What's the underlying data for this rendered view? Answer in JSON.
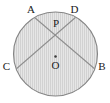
{
  "figure": {
    "kind": "circle-geometry-diagram",
    "canvas": {
      "width": 110,
      "height": 103
    },
    "colors": {
      "fill": "#e2e2e2",
      "hatch": "#cfcfcf",
      "outline": "#7d7d7d",
      "chord": "#8a8a8a",
      "label": "#1a1a1a",
      "background": "#ffffff"
    },
    "circle": {
      "center_x": 55.5,
      "center_y": 54.0,
      "radius": 42.0,
      "filled": true,
      "hatched": true,
      "hatch_orientation": "vertical",
      "hatch_spacing": 2
    },
    "center_marker": {
      "label": "O",
      "dot_x": 55.5,
      "dot_y": 57.0,
      "label_x": 55.5,
      "label_y": 66.0,
      "has_dot": true
    },
    "points": [
      {
        "name": "A",
        "label": "A",
        "x": 34.0,
        "y": 17.0,
        "label_x": 31.0,
        "label_y": 9.0
      },
      {
        "name": "D",
        "label": "D",
        "x": 76.0,
        "y": 17.0,
        "label_x": 74.0,
        "label_y": 9.0
      },
      {
        "name": "C",
        "label": "C",
        "x": 15.0,
        "y": 70.0,
        "label_x": 6.0,
        "label_y": 66.0
      },
      {
        "name": "B",
        "label": "B",
        "x": 96.0,
        "y": 70.0,
        "label_x": 101.0,
        "label_y": 66.0
      },
      {
        "name": "P",
        "label": "P",
        "x": 55.5,
        "y": 31.0,
        "label_x": 56.0,
        "label_y": 23.0
      }
    ],
    "chords": [
      {
        "name": "chord-AB",
        "from": "A",
        "to": "B",
        "x1": 34.0,
        "y1": 17.0,
        "x2": 96.0,
        "y2": 70.0
      },
      {
        "name": "chord-DC",
        "from": "D",
        "to": "C",
        "x1": 76.0,
        "y1": 17.0,
        "x2": 15.0,
        "y2": 70.0
      }
    ],
    "intersection": {
      "name": "P",
      "x": 55.5,
      "y": 31.0
    }
  }
}
